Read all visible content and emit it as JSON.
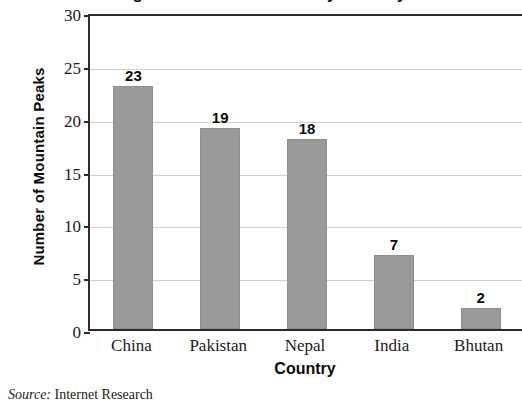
{
  "chart_data": {
    "type": "bar",
    "title": "Highest Mountain Peaks by Country",
    "title_clipped": true,
    "categories": [
      "China",
      "Pakistan",
      "Nepal",
      "India",
      "Bhutan"
    ],
    "values": [
      23,
      19,
      18,
      7,
      2
    ],
    "value_labels": [
      "23",
      "19",
      "18",
      "7",
      "2"
    ],
    "xlabel": "Country",
    "ylabel": "Number of Mountain Peaks",
    "ylim": [
      0,
      30
    ],
    "ytick_step": 5,
    "yticks": [
      "30",
      "25",
      "20",
      "15",
      "10",
      "5",
      "0"
    ],
    "grid": true,
    "legend": "none",
    "bar_color": "#9a9a9a",
    "axis_color": "#2b2b2b",
    "grid_color": "#cfcfcf",
    "text_color": "#0c0c0c"
  },
  "source_note": {
    "key": "Source:",
    "value": "Internet Research"
  }
}
